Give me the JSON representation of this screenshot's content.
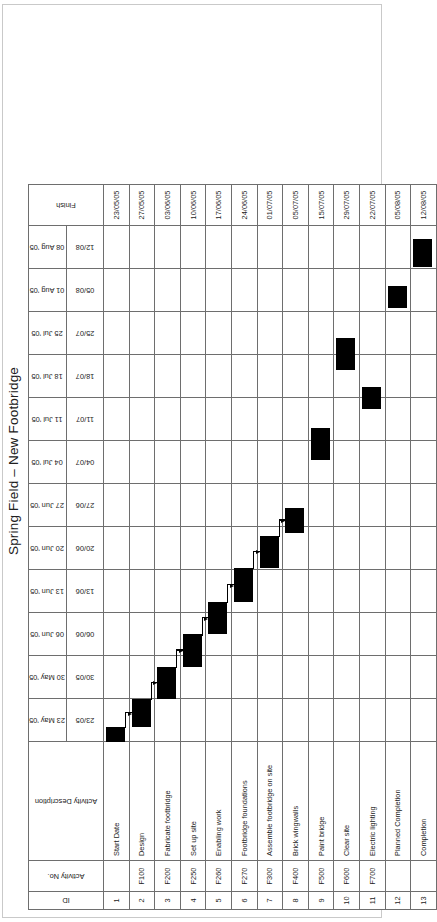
{
  "title": "Spring Field – New Footbridge",
  "columns": {
    "id": "ID",
    "activity_no": "Activity No.",
    "description": "Activity Description",
    "finish": "Finish"
  },
  "timeline": [
    {
      "week_label": "23 May '05",
      "short": "23/05"
    },
    {
      "week_label": "30 May '05",
      "short": "30/05"
    },
    {
      "week_label": "06 Jun '05",
      "short": "06/06"
    },
    {
      "week_label": "13 Jun '05",
      "short": "13/06"
    },
    {
      "week_label": "20 Jun '05",
      "short": "20/06"
    },
    {
      "week_label": "27 Jun '05",
      "short": "27/06"
    },
    {
      "week_label": "04 Jul '05",
      "short": "04/07"
    },
    {
      "week_label": "11 Jul '05",
      "short": "11/07"
    },
    {
      "week_label": "18 Jul '05",
      "short": "18/07"
    },
    {
      "week_label": "25 Jul '05",
      "short": "25/07"
    },
    {
      "week_label": "01 Aug '05",
      "short": "05/08"
    },
    {
      "week_label": "08 Aug '05",
      "short": "12/08"
    }
  ],
  "rows": [
    {
      "id": "1",
      "no": "",
      "desc": "Start Date",
      "finish": "23/05/05"
    },
    {
      "id": "2",
      "no": "F100",
      "desc": "Design",
      "finish": "27/05/05"
    },
    {
      "id": "3",
      "no": "F200",
      "desc": "Fabricate footbridge",
      "finish": "03/06/05"
    },
    {
      "id": "4",
      "no": "F250",
      "desc": "Set up site",
      "finish": "10/06/05"
    },
    {
      "id": "5",
      "no": "F260",
      "desc": "Enabling work",
      "finish": "17/06/05"
    },
    {
      "id": "6",
      "no": "F270",
      "desc": "Footbridge foundations",
      "finish": "24/06/05"
    },
    {
      "id": "7",
      "no": "F300",
      "desc": "Assemble footbridge on site",
      "finish": "01/07/05"
    },
    {
      "id": "8",
      "no": "F400",
      "desc": "Brick wingwalls",
      "finish": "05/07/05"
    },
    {
      "id": "9",
      "no": "F500",
      "desc": "Paint bridge",
      "finish": "15/07/05"
    },
    {
      "id": "10",
      "no": "F600",
      "desc": "Clear site",
      "finish": "29/07/05"
    },
    {
      "id": "11",
      "no": "F700",
      "desc": "Electric lighting",
      "finish": "22/07/05"
    },
    {
      "id": "12",
      "no": "",
      "desc": "Planned Completion",
      "finish": "05/08/05"
    },
    {
      "id": "13",
      "no": "",
      "desc": "Completion",
      "finish": "12/08/05"
    }
  ],
  "chart_data": {
    "type": "bar",
    "title": "Spring Field – New Footbridge",
    "xlabel": "Week commencing",
    "ylabel": "Activity",
    "grid": true,
    "legend": false,
    "categories": [
      "Start Date",
      "Design",
      "Fabricate footbridge",
      "Set up site",
      "Enabling work",
      "Footbridge foundations",
      "Assemble footbridge on site",
      "Brick wingwalls",
      "Paint bridge",
      "Clear site",
      "Electric lighting",
      "Planned Completion",
      "Completion"
    ],
    "x_tick_labels": [
      "23 May '05",
      "30 May '05",
      "06 Jun '05",
      "13 Jun '05",
      "20 Jun '05",
      "27 Jun '05",
      "04 Jul '05",
      "11 Jul '05",
      "18 Jul '05",
      "25 Jul '05",
      "01 Aug '05",
      "08 Aug '05"
    ],
    "bar_color": "#000000",
    "bars": [
      {
        "row": 1,
        "activity": "Start Date",
        "start_week": 0,
        "end_week": 0.35,
        "finish": "23/05/05"
      },
      {
        "row": 2,
        "activity": "Design",
        "start_week": 0.35,
        "end_week": 1.0,
        "finish": "27/05/05"
      },
      {
        "row": 3,
        "activity": "Fabricate footbridge",
        "start_week": 1.0,
        "end_week": 1.75,
        "finish": "03/06/05"
      },
      {
        "row": 4,
        "activity": "Set up site",
        "start_week": 1.75,
        "end_week": 2.5,
        "finish": "10/06/05"
      },
      {
        "row": 5,
        "activity": "Enabling work",
        "start_week": 2.5,
        "end_week": 3.25,
        "finish": "17/06/05"
      },
      {
        "row": 6,
        "activity": "Footbridge foundations",
        "start_week": 3.25,
        "end_week": 4.05,
        "finish": "24/06/05"
      },
      {
        "row": 7,
        "activity": "Assemble footbridge on site",
        "start_week": 4.05,
        "end_week": 4.8,
        "finish": "01/07/05"
      },
      {
        "row": 8,
        "activity": "Brick wingwalls",
        "start_week": 4.85,
        "end_week": 5.45,
        "finish": "05/07/05"
      },
      {
        "row": 9,
        "activity": "Paint bridge",
        "start_week": 6.55,
        "end_week": 7.3,
        "finish": "15/07/05"
      },
      {
        "row": 10,
        "activity": "Clear site",
        "start_week": 8.65,
        "end_week": 9.4,
        "finish": "29/07/05"
      },
      {
        "row": 11,
        "activity": "Electric lighting",
        "start_week": 7.75,
        "end_week": 8.25,
        "finish": "22/07/05"
      },
      {
        "row": 12,
        "activity": "Planned Completion",
        "start_week": 10.1,
        "end_week": 10.6,
        "finish": "05/08/05"
      },
      {
        "row": 13,
        "activity": "Completion",
        "start_week": 11.05,
        "end_week": 11.7,
        "finish": "12/08/05"
      }
    ],
    "links": [
      {
        "from_row": 1,
        "to_row": 2
      },
      {
        "from_row": 2,
        "to_row": 3
      },
      {
        "from_row": 3,
        "to_row": 4
      },
      {
        "from_row": 4,
        "to_row": 5
      },
      {
        "from_row": 5,
        "to_row": 6
      },
      {
        "from_row": 6,
        "to_row": 7
      },
      {
        "from_row": 7,
        "to_row": 8
      }
    ]
  }
}
